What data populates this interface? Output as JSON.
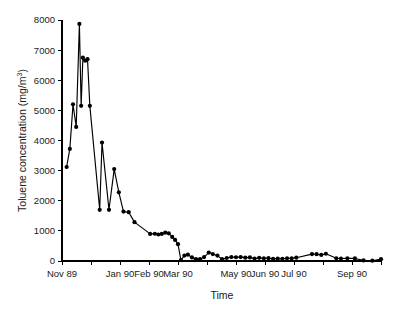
{
  "chart_data": {
    "type": "line",
    "title": "",
    "subtitle": "",
    "xlabel": "Time",
    "ylabel": "Toluene concentration (mg/m3)",
    "ylabel_display": "Toluene concentration (mg/m",
    "ylabel_super": "3",
    "ylabel_tail": ")",
    "legend": [],
    "legend_position": "none",
    "grid": false,
    "marker": "filled-circle",
    "line_color": "#000000",
    "marker_color": "#000000",
    "ylim": [
      0,
      8000
    ],
    "yticks": [
      0,
      1000,
      2000,
      3000,
      4000,
      5000,
      6000,
      7000,
      8000
    ],
    "ytick_labels": [
      "0",
      "1000",
      "2000",
      "3000",
      "4000",
      "5000",
      "6000",
      "7000",
      "8000"
    ],
    "xlim": [
      0,
      11
    ],
    "xticks": [
      0,
      1,
      2,
      3,
      4,
      5,
      6,
      7,
      8,
      9,
      10,
      11
    ],
    "xtick_labels": [
      "Nov 89",
      "",
      "Jan 90",
      "Feb 90",
      "Mar 90",
      "",
      "May 90",
      "Jun 90",
      "Jul 90",
      "",
      "Sep 90",
      ""
    ],
    "xtick_labeled": [
      "Nov 89",
      "Jan 90",
      "Feb 90",
      "Mar 90",
      "May 90",
      "Jun 90",
      "Jul 90",
      "Sep 90"
    ],
    "x_unit": "month",
    "series": [
      {
        "name": "Toluene concentration",
        "x": [
          0.16,
          0.27,
          0.38,
          0.49,
          0.6,
          0.66,
          0.72,
          0.8,
          0.88,
          0.96,
          1.3,
          1.38,
          1.62,
          1.8,
          1.96,
          2.12,
          2.3,
          2.5,
          3.04,
          3.2,
          3.32,
          3.44,
          3.56,
          3.68,
          3.8,
          3.9,
          4.0,
          4.1,
          4.22,
          4.34,
          4.48,
          4.62,
          4.76,
          4.9,
          5.06,
          5.2,
          5.36,
          5.52,
          5.68,
          5.84,
          6.0,
          6.16,
          6.32,
          6.48,
          6.64,
          6.8,
          6.96,
          7.12,
          7.28,
          7.44,
          7.6,
          7.76,
          7.92,
          8.08,
          8.62,
          8.78,
          8.94,
          9.1,
          9.46,
          9.62,
          9.84,
          10.1,
          10.4,
          10.7,
          11.0
        ],
        "values": [
          3120,
          3720,
          5200,
          4450,
          7870,
          5150,
          6750,
          6650,
          6700,
          5150,
          1700,
          3930,
          1700,
          3050,
          2280,
          1640,
          1620,
          1290,
          900,
          905,
          880,
          900,
          940,
          920,
          800,
          700,
          560,
          30,
          180,
          210,
          120,
          60,
          60,
          130,
          280,
          230,
          180,
          60,
          100,
          130,
          125,
          130,
          110,
          120,
          80,
          105,
          90,
          95,
          70,
          80,
          75,
          90,
          90,
          110,
          230,
          225,
          200,
          240,
          90,
          80,
          90,
          85,
          20,
          10,
          60
        ]
      }
    ]
  },
  "figure": {
    "background_color": "#ffffff",
    "foreground_color": "#000000",
    "plot_left_px": 62,
    "plot_right_px": 381,
    "plot_top_px": 20,
    "plot_bottom_px": 261
  }
}
